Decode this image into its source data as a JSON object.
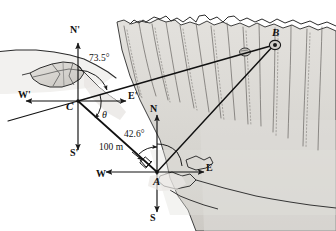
{
  "figure": {
    "type": "surveying-diagram",
    "points": [
      {
        "id": "A",
        "label": "A",
        "x": 157,
        "y": 172,
        "role": "canyon-floor-station"
      },
      {
        "id": "B",
        "label": "B",
        "x": 276,
        "y": 43,
        "role": "far-rim-target"
      },
      {
        "id": "C",
        "label": "C",
        "x": 78,
        "y": 101,
        "role": "near-rim-station"
      }
    ],
    "compass_primary": {
      "origin_point": "A",
      "north": "N",
      "east": "E",
      "south": "S",
      "west": "W"
    },
    "compass_secondary": {
      "origin_point": "C",
      "north": "N'",
      "east": "E'",
      "south": "S'",
      "west": "W'"
    },
    "angles": [
      {
        "name": "angle-at-C-from-north",
        "label": "73.5°",
        "vertex": "C"
      },
      {
        "name": "angle-theta-at-C",
        "label": "θ",
        "vertex": "C"
      },
      {
        "name": "angle-at-A-from-north",
        "label": "42.6°",
        "vertex": "A"
      }
    ],
    "distances": [
      {
        "name": "baseline-C-to-A",
        "label": "100 m",
        "from": "C",
        "to": "A"
      }
    ],
    "segments": [
      {
        "name": "segment-C-to-A",
        "from": "C",
        "to": "A"
      },
      {
        "name": "segment-C-to-B",
        "from": "C",
        "to": "B"
      },
      {
        "name": "segment-A-to-B",
        "from": "A",
        "to": "B"
      }
    ],
    "markers": [
      {
        "name": "right-angle-marker-at-A",
        "vertex": "A"
      }
    ],
    "colors": {
      "ink": "#1a1a1a",
      "rock_fill": "#d9d7d2",
      "rock_fill_light": "#e6e4e0",
      "rock_shadow": "#b9b6b0",
      "paper": "#ffffff"
    }
  }
}
